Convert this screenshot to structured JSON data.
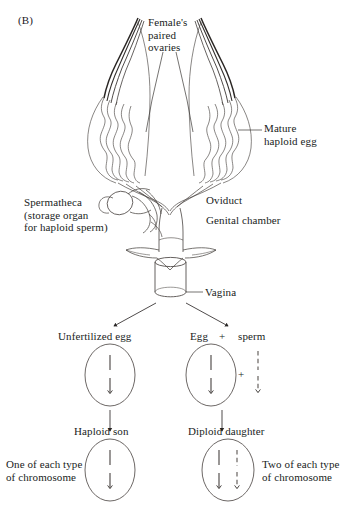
{
  "figure": {
    "panel_label": "(B)",
    "organism_note": "insect female reproductive tract with haplodiploid sex determination"
  },
  "anatomy_labels": {
    "ovaries": "Female's\npaired\novaries",
    "mature_egg": "Mature\nhaploid egg",
    "spermatheca": "Spermatheca\n(storage organ\nfor haploid sperm)",
    "oviduct": "Oviduct",
    "genital_chamber": "Genital chamber",
    "vagina": "Vagina"
  },
  "pathways": {
    "left": {
      "gamete_label": "Unfertilized egg",
      "offspring_label": "Haploid son",
      "chromosome_note": "One of each type\nof chromosome",
      "cell_chromosomes": [
        {
          "style": "solid"
        }
      ],
      "offspring_chromosomes": [
        {
          "style": "solid"
        }
      ]
    },
    "right": {
      "gamete_label_egg": "Egg",
      "gamete_plus": "+",
      "gamete_label_sperm": "sperm",
      "fusion_plus": "+",
      "offspring_label": "Diploid daughter",
      "chromosome_note": "Two of each type\nof chromosome",
      "cell_chromosomes": [
        {
          "style": "solid"
        }
      ],
      "free_sperm_chromosomes": [
        {
          "style": "dashed"
        }
      ],
      "offspring_chromosomes": [
        {
          "style": "solid"
        },
        {
          "style": "dashed"
        }
      ]
    }
  },
  "colors": {
    "ink": "#201d1c",
    "line": "#3a3634",
    "background": "#ffffff"
  }
}
